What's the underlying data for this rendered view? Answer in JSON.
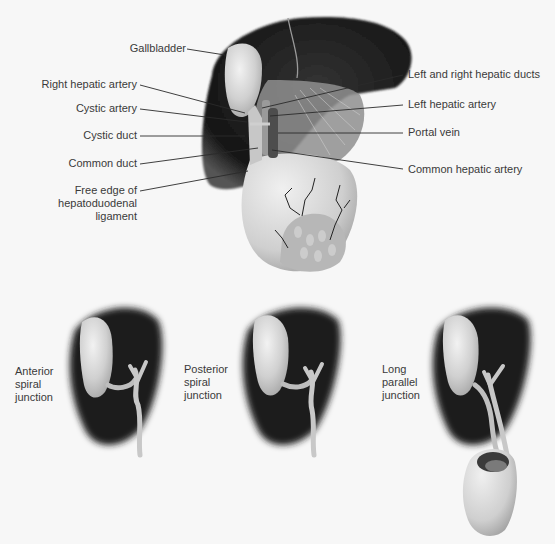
{
  "main_diagram": {
    "title": "Biliary anatomy — liver, gallbladder and hepatoduodenal ligament",
    "left_labels": [
      {
        "id": "gallbladder",
        "text": "Gallbladder"
      },
      {
        "id": "right-hepatic-artery",
        "text": "Right hepatic artery"
      },
      {
        "id": "cystic-artery",
        "text": "Cystic artery"
      },
      {
        "id": "cystic-duct",
        "text": "Cystic duct"
      },
      {
        "id": "common-duct",
        "text": "Common duct"
      },
      {
        "id": "free-edge",
        "text": "Free edge of hepatoduodenal ligament",
        "lines": [
          "Free edge of",
          "hepatoduodenal",
          "ligament"
        ]
      }
    ],
    "right_labels": [
      {
        "id": "left-right-hepatic-ducts",
        "text": "Left and right hepatic ducts"
      },
      {
        "id": "left-hepatic-artery",
        "text": "Left hepatic artery"
      },
      {
        "id": "portal-vein",
        "text": "Portal vein"
      },
      {
        "id": "common-hepatic-artery",
        "text": "Common hepatic artery"
      }
    ]
  },
  "variants": [
    {
      "id": "anterior",
      "lines": [
        "Anterior",
        "spiral",
        "junction"
      ]
    },
    {
      "id": "posterior",
      "lines": [
        "Posterior",
        "spiral",
        "junction"
      ]
    },
    {
      "id": "long-parallel",
      "lines": [
        "Long",
        "parallel",
        "junction"
      ]
    }
  ],
  "colors": {
    "background": "#f7f7f7",
    "liver": "#1e1e1e",
    "gallbladder": "#d8d8d8",
    "ligament": "#bdbdbd",
    "duodenum": "#d4d4d4",
    "text": "#3a3a3a",
    "leader": "#2a2a2a"
  }
}
